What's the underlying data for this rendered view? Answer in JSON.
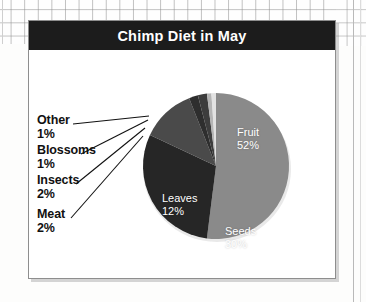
{
  "background": {
    "kind": "graph-paper",
    "grid_color": "#8c8c8c",
    "paper_color": "#fefefe"
  },
  "chart_panel": {
    "title": "Chimp Diet in May",
    "title_bar_color": "#1c1c1c",
    "title_text_color": "#ffffff",
    "panel_background": "#ffffff",
    "panel_border_color": "#8e8e8e"
  },
  "chart_data": {
    "type": "pie",
    "title": "Chimp Diet in May",
    "xlabel": "",
    "ylabel": "",
    "legend_position": "none",
    "grid": false,
    "units": "percent",
    "total": 100,
    "categories": [
      "Fruit",
      "Seeds",
      "Leaves",
      "Meat",
      "Insects",
      "Blossoms",
      "Other"
    ],
    "values": [
      52,
      30,
      12,
      2,
      2,
      1,
      1
    ],
    "colors": [
      "#8a8a8a",
      "#262626",
      "#4a4a4a",
      "#2e2e2e",
      "#3d3d3d",
      "#b5b5b5",
      "#e2e2e2"
    ],
    "slices": [
      {
        "name": "Fruit",
        "value": 52,
        "label": "Fruit",
        "pct_label": "52%",
        "color": "#8a8a8a",
        "label_placement": "inside"
      },
      {
        "name": "Seeds",
        "value": 30,
        "label": "Seeds",
        "pct_label": "30%",
        "color": "#262626",
        "label_placement": "inside"
      },
      {
        "name": "Leaves",
        "value": 12,
        "label": "Leaves",
        "pct_label": "12%",
        "color": "#4a4a4a",
        "label_placement": "inside"
      },
      {
        "name": "Meat",
        "value": 2,
        "label": "Meat",
        "pct_label": "2%",
        "color": "#2e2e2e",
        "label_placement": "callout"
      },
      {
        "name": "Insects",
        "value": 2,
        "label": "Insects",
        "pct_label": "2%",
        "color": "#3d3d3d",
        "label_placement": "callout"
      },
      {
        "name": "Blossoms",
        "value": 1,
        "label": "Blossoms",
        "pct_label": "1%",
        "color": "#b5b5b5",
        "label_placement": "callout"
      },
      {
        "name": "Other",
        "value": 1,
        "label": "Other",
        "pct_label": "1%",
        "color": "#e2e2e2",
        "label_placement": "callout"
      }
    ]
  }
}
